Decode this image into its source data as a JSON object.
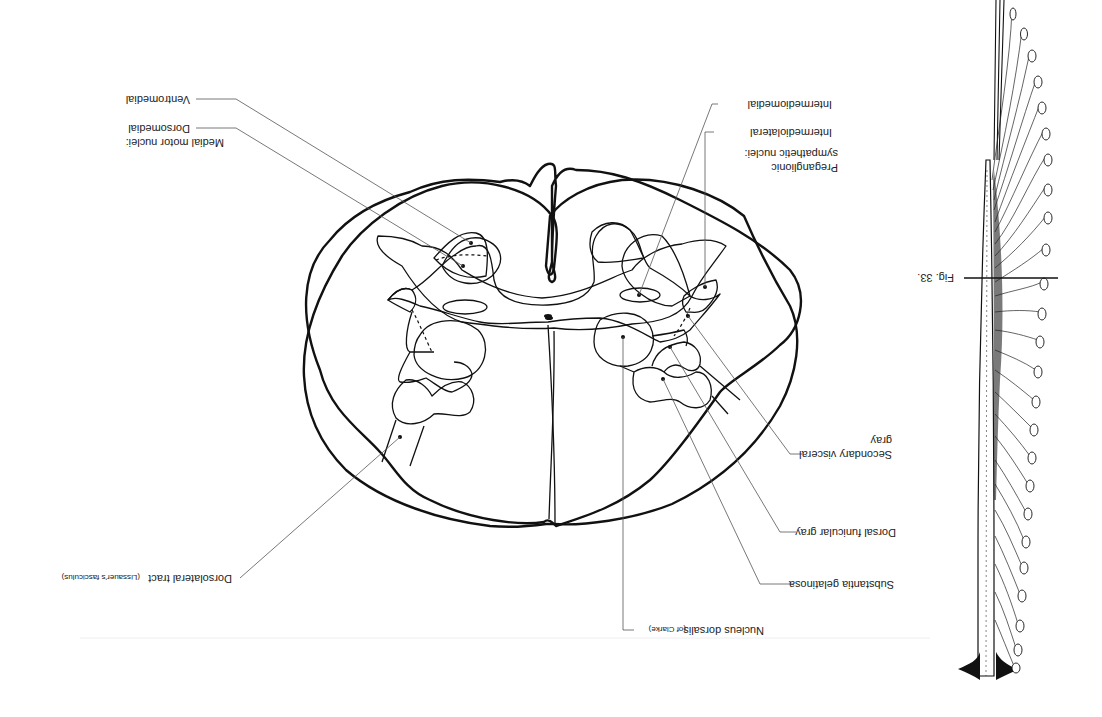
{
  "figure": {
    "orientation": "rotated-180",
    "caption_marker": "Fig. 33."
  },
  "labels": {
    "ventromedial": "Ventromedial",
    "medial_motor_group": "Medial motor nuclei:",
    "dorsomedial": "Dorsomedial",
    "intermediomedial": "Intermediomedial",
    "intermediolateral": "Intermediolateral",
    "preganglionic_line1": "Preganglionic",
    "preganglionic_line2": "sympathetic nuclei:",
    "secondary_visceral_line1": "Secondary visceral",
    "secondary_visceral_line2": "gray",
    "dorsal_funicular": "Dorsal funicular gray",
    "substantia_gelatinosa": "Substantia gelatinosa",
    "nucleus_dorsalis": "Nucleus dorsalis",
    "nucleus_dorsalis_suffix": "(of Clarke)",
    "dorsolateral_tract": "Dorsolateral tract",
    "dorsolateral_tract_suffix": "(Lissauer's fasciculus)"
  },
  "colors": {
    "ink": "#111111",
    "leader": "#555555",
    "background": "#ffffff"
  }
}
